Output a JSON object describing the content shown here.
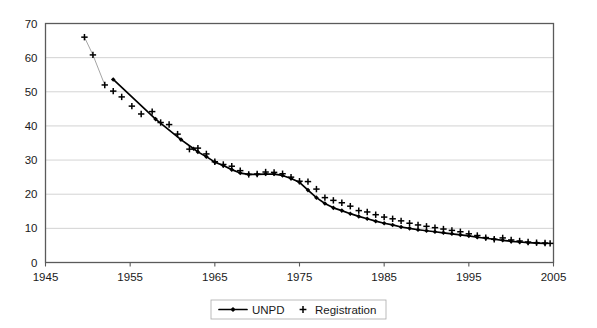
{
  "chart_data": {
    "type": "line",
    "title": "",
    "subtitle": "",
    "xlabel": "",
    "ylabel": "",
    "xlim": [
      1945,
      2005
    ],
    "ylim": [
      0,
      70
    ],
    "xticks": [
      1945,
      1955,
      1965,
      1975,
      1985,
      1995,
      2005
    ],
    "xtick_labels": [
      "1945",
      "1955",
      "1965",
      "1975",
      "1985",
      "1995",
      "2005"
    ],
    "yticks": [
      0,
      10,
      20,
      30,
      40,
      50,
      60,
      70
    ],
    "ytick_labels": [
      "0",
      "10",
      "20",
      "30",
      "40",
      "50",
      "60",
      "70"
    ],
    "grid": "horizontal",
    "legend_position": "bottom-center",
    "series": [
      {
        "name": "UNPD",
        "marker": "diamond",
        "line": "solid-thick",
        "color": "#000000",
        "points": [
          [
            1953.0,
            53.6
          ],
          [
            1958.0,
            42.0
          ],
          [
            1961.0,
            36.0
          ],
          [
            1962.5,
            33.3
          ],
          [
            1963.0,
            32.4
          ],
          [
            1964.0,
            31.0
          ],
          [
            1965.0,
            29.4
          ],
          [
            1966.0,
            28.4
          ],
          [
            1967.0,
            27.2
          ],
          [
            1968.0,
            26.2
          ],
          [
            1969.0,
            25.8
          ],
          [
            1970.0,
            25.8
          ],
          [
            1971.0,
            25.9
          ],
          [
            1972.0,
            25.9
          ],
          [
            1973.0,
            25.5
          ],
          [
            1974.0,
            24.6
          ],
          [
            1975.0,
            23.5
          ],
          [
            1976.0,
            21.2
          ],
          [
            1977.0,
            19.0
          ],
          [
            1978.0,
            17.3
          ],
          [
            1979.0,
            16.0
          ],
          [
            1980.0,
            15.2
          ],
          [
            1981.0,
            14.3
          ],
          [
            1982.0,
            13.5
          ],
          [
            1983.0,
            12.8
          ],
          [
            1984.0,
            12.1
          ],
          [
            1985.0,
            11.5
          ],
          [
            1986.0,
            11.0
          ],
          [
            1987.0,
            10.4
          ],
          [
            1988.0,
            10.0
          ],
          [
            1989.0,
            9.6
          ],
          [
            1990.0,
            9.3
          ],
          [
            1991.0,
            9.0
          ],
          [
            1992.0,
            8.7
          ],
          [
            1993.0,
            8.4
          ],
          [
            1994.0,
            8.1
          ],
          [
            1995.0,
            7.8
          ],
          [
            1996.0,
            7.4
          ],
          [
            1997.0,
            7.1
          ],
          [
            1998.0,
            6.8
          ],
          [
            1999.0,
            6.5
          ],
          [
            2000.0,
            6.2
          ],
          [
            2001.0,
            6.0
          ],
          [
            2002.0,
            5.8
          ],
          [
            2003.0,
            5.7
          ],
          [
            2004.0,
            5.6
          ]
        ]
      },
      {
        "name": "Registration",
        "marker": "plus",
        "line": "faint-thin",
        "color": "#000000",
        "points": [
          [
            1949.6,
            66.0
          ],
          [
            1950.6,
            60.8
          ],
          [
            1952.0,
            52.0
          ],
          [
            1953.0,
            50.2
          ],
          [
            1954.0,
            48.5
          ],
          [
            1955.2,
            45.8
          ],
          [
            1956.3,
            43.5
          ],
          [
            1957.6,
            44.2
          ],
          [
            1958.6,
            41.0
          ],
          [
            1959.6,
            40.4
          ],
          [
            1960.6,
            37.6
          ],
          [
            1962.0,
            33.2
          ],
          [
            1963.0,
            33.5
          ],
          [
            1964.0,
            31.8
          ],
          [
            1965.0,
            29.5
          ],
          [
            1966.0,
            28.7
          ],
          [
            1967.0,
            28.2
          ],
          [
            1968.0,
            26.9
          ],
          [
            1969.0,
            25.8
          ],
          [
            1970.0,
            25.9
          ],
          [
            1971.0,
            26.5
          ],
          [
            1972.0,
            26.4
          ],
          [
            1973.0,
            26.0
          ],
          [
            1974.0,
            25.0
          ],
          [
            1975.0,
            23.8
          ],
          [
            1976.0,
            23.7
          ],
          [
            1977.0,
            21.5
          ],
          [
            1978.0,
            19.0
          ],
          [
            1979.0,
            18.2
          ],
          [
            1980.0,
            17.5
          ],
          [
            1981.0,
            16.5
          ],
          [
            1982.0,
            15.2
          ],
          [
            1983.0,
            14.8
          ],
          [
            1984.0,
            14.0
          ],
          [
            1985.0,
            13.3
          ],
          [
            1986.0,
            12.8
          ],
          [
            1987.0,
            12.2
          ],
          [
            1988.0,
            11.5
          ],
          [
            1989.0,
            11.0
          ],
          [
            1990.0,
            10.6
          ],
          [
            1991.0,
            10.2
          ],
          [
            1992.0,
            9.8
          ],
          [
            1993.0,
            9.4
          ],
          [
            1994.0,
            9.0
          ],
          [
            1995.0,
            8.4
          ],
          [
            1996.0,
            7.9
          ],
          [
            1997.0,
            7.3
          ],
          [
            1998.0,
            6.8
          ],
          [
            1999.0,
            7.2
          ],
          [
            2000.0,
            6.6
          ],
          [
            2001.0,
            6.3
          ],
          [
            2002.0,
            6.0
          ],
          [
            2003.0,
            5.8
          ],
          [
            2004.0,
            5.7
          ],
          [
            2004.6,
            5.6
          ]
        ]
      }
    ],
    "legend": [
      {
        "label": "UNPD",
        "marker": "line-diamond"
      },
      {
        "label": "Registration",
        "marker": "plus"
      }
    ]
  },
  "colors": {
    "series": "#000000",
    "grid": "#c8c8c8",
    "axis": "#5a5a5a",
    "background": "#ffffff",
    "faint_line": "#9a9a9a"
  }
}
